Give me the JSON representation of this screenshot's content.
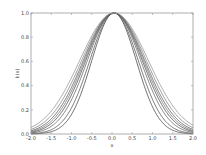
{
  "chart_data": {
    "type": "line",
    "title": "",
    "xlabel": "x",
    "ylabel": "k(x)",
    "xlim": [
      -2.0,
      2.0
    ],
    "ylim": [
      0.0,
      1.0
    ],
    "xticks": [
      "-2.0",
      "-1.5",
      "-1.0",
      "-0.5",
      "0.0",
      "0.5",
      "1.0",
      "1.5",
      "2.0"
    ],
    "yticks": [
      "0.0",
      "0.2",
      "0.4",
      "0.6",
      "0.8",
      "1.0"
    ],
    "grid": false,
    "legend": null,
    "function": "k(x) = exp(-(x - c)^2 / (2 * l^2))",
    "center": 0.05,
    "series": [
      {
        "name": "l=0.55",
        "length_scale": 0.55,
        "color": "#333333"
      },
      {
        "name": "l=0.60",
        "length_scale": 0.6,
        "color": "#444444"
      },
      {
        "name": "l=0.66",
        "length_scale": 0.66,
        "color": "#555555"
      },
      {
        "name": "l=0.70",
        "length_scale": 0.7,
        "color": "#3a3a3a"
      },
      {
        "name": "l=0.73",
        "length_scale": 0.73,
        "color": "#666666"
      },
      {
        "name": "l=0.76",
        "length_scale": 0.76,
        "color": "#4a4a4a"
      },
      {
        "name": "l=0.80",
        "length_scale": 0.8,
        "color": "#777777"
      },
      {
        "name": "l=0.85",
        "length_scale": 0.85,
        "color": "#888888"
      }
    ]
  },
  "plot_area": {
    "left": 31,
    "top": 13,
    "right": 193,
    "bottom": 134
  }
}
